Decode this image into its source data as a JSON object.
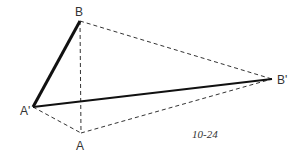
{
  "figure": {
    "caption": "10-24",
    "points": {
      "B": {
        "label": "B",
        "x": 80,
        "y": 21
      },
      "A_prime": {
        "label": "A'",
        "x": 33,
        "y": 107
      },
      "A": {
        "label": "A",
        "x": 81,
        "y": 133
      },
      "B_prime": {
        "label": "B'",
        "x": 272,
        "y": 79
      }
    },
    "solid_segments": [
      [
        "B",
        "A_prime"
      ],
      [
        "A_prime",
        "B_prime"
      ]
    ],
    "dashed_segments": [
      [
        "B",
        "A"
      ],
      [
        "B",
        "B_prime"
      ],
      [
        "A_prime",
        "A"
      ],
      [
        "A",
        "B_prime"
      ]
    ],
    "colors": {
      "line": "#111111",
      "dash": "#333333",
      "text": "#333333"
    }
  }
}
